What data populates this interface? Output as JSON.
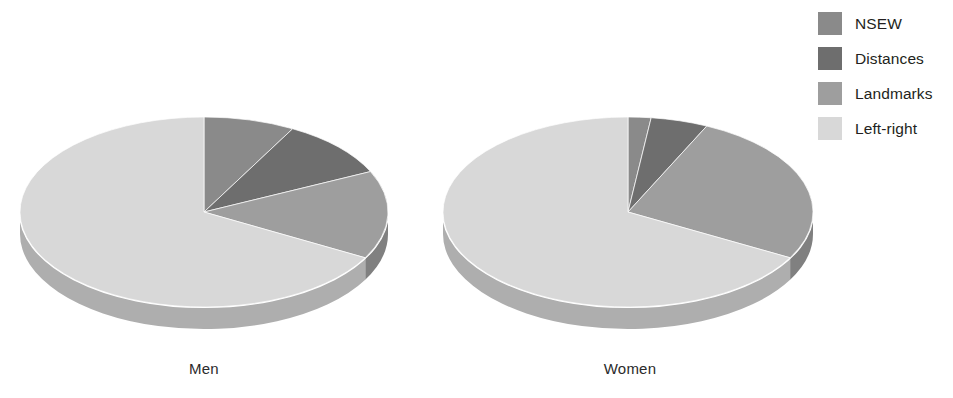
{
  "figure": {
    "background": "#ffffff",
    "caption_men": "Men",
    "caption_women": "Women"
  },
  "legend": {
    "position": "top-right",
    "items": [
      {
        "label": "NSEW",
        "color": "#8a8a8a"
      },
      {
        "label": "Distances",
        "color": "#6e6e6e"
      },
      {
        "label": "Landmarks",
        "color": "#9e9e9e"
      },
      {
        "label": "Left-right",
        "color": "#d8d8d8"
      }
    ]
  },
  "chart_data": {
    "type": "pie",
    "title": "",
    "subtitle": "",
    "xlabel": "",
    "ylabel": "",
    "grid": false,
    "legend_position": "top-right",
    "three_d": true,
    "start_angle_deg": 0,
    "direction": "clockwise",
    "categories": [
      "NSEW",
      "Distances",
      "Landmarks",
      "Left-right"
    ],
    "colors": [
      "#8a8a8a",
      "#6e6e6e",
      "#9e9e9e",
      "#d8d8d8"
    ],
    "side_colors": [
      "#6f6f6f",
      "#575757",
      "#808080",
      "#aeaeae"
    ],
    "charts": [
      {
        "name": "Men",
        "label": "Men",
        "center": [
          204,
          212
        ],
        "radius_x": 184,
        "radius_y": 95,
        "depth": 22,
        "values": [
          8,
          10,
          15,
          67
        ],
        "units": "percent"
      },
      {
        "name": "Women",
        "label": "Women",
        "center": [
          628,
          212
        ],
        "radius_x": 185,
        "radius_y": 95,
        "depth": 22,
        "values": [
          2,
          5,
          26,
          67
        ],
        "units": "percent"
      }
    ]
  }
}
